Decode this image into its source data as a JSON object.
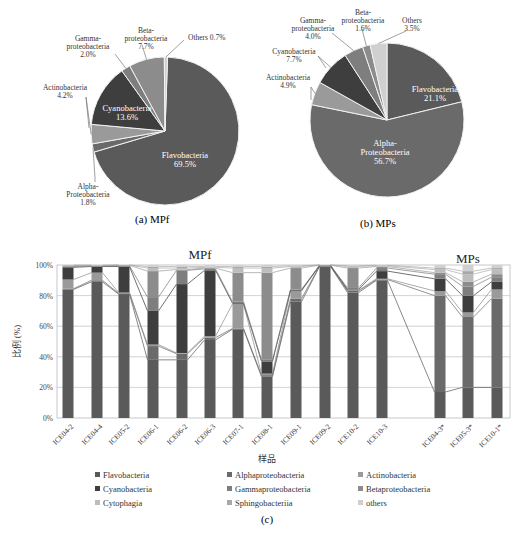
{
  "colors": {
    "Flavobacteria": "#5a5a5a",
    "Alphaproteobacteria": "#6a6a6a",
    "Actinobacteria": "#9a9a9a",
    "Cyanobacteria": "#3e3e3e",
    "Gammaproteobacteria": "#7e7e7e",
    "Betaproteobacteria": "#8c8c8c",
    "Cytophagia": "#bdbdbd",
    "Sphingobacteriia": "#a8a8a8",
    "others": "#d0d0d0"
  },
  "chart_data": [
    {
      "type": "pie",
      "id": "a",
      "caption": "(a) MPf",
      "slices": [
        {
          "name": "Flavobacteria",
          "label": "Flavobacteria",
          "pct_text": "69.5%",
          "value": 69.5
        },
        {
          "name": "Alphaproteobacteria",
          "label": "Alpha-\nProteobacteria",
          "pct_text": "1.8%",
          "value": 1.8
        },
        {
          "name": "Actinobacteria",
          "label": "Actinobacteria",
          "pct_text": "4.2%",
          "value": 4.2
        },
        {
          "name": "Cyanobacteria",
          "label": "Cyanobacteria",
          "pct_text": "13.6%",
          "value": 13.6
        },
        {
          "name": "Gammaproteobacteria",
          "label": "Gamma-\nproteobacteria",
          "pct_text": "2.0%",
          "value": 2.0
        },
        {
          "name": "Betaproteobacteria",
          "label": "Beta-\nproteobacteria",
          "pct_text": "7.7%",
          "value": 7.7
        },
        {
          "name": "others",
          "label": "Others",
          "pct_text": "0.7%",
          "value": 0.7
        }
      ]
    },
    {
      "type": "pie",
      "id": "b",
      "caption": "(b) MPs",
      "slices": [
        {
          "name": "Flavobacteria",
          "label": "Flavobacteria",
          "pct_text": "21.1%",
          "value": 21.1
        },
        {
          "name": "Alphaproteobacteria",
          "label": "Alpha-\nProteobacteria",
          "pct_text": "56.7%",
          "value": 56.7
        },
        {
          "name": "Actinobacteria",
          "label": "Actinobacteria",
          "pct_text": "4.9%",
          "value": 4.9
        },
        {
          "name": "Cyanobacteria",
          "label": "Cyanobacteria",
          "pct_text": "7.7%",
          "value": 7.7
        },
        {
          "name": "Gammaproteobacteria",
          "label": "Gamma-\nproteobacteria",
          "pct_text": "4.0%",
          "value": 4.0
        },
        {
          "name": "Betaproteobacteria",
          "label": "Beta-\nproteobacteria",
          "pct_text": "1.6%",
          "value": 1.6
        },
        {
          "name": "others",
          "label": "Others",
          "pct_text": "3.5%",
          "value": 3.5
        }
      ]
    },
    {
      "type": "bar",
      "subtype": "stacked-100",
      "id": "c",
      "caption": "(c)",
      "group_labels": [
        "MPf",
        "MPs"
      ],
      "xlabel": "样品",
      "ylabel": "比例 (%)",
      "ylim": [
        0,
        100
      ],
      "yticks": [
        "0%",
        "20%",
        "40%",
        "60%",
        "80%",
        "100%"
      ],
      "grid": true,
      "legend_position": "bottom",
      "series_order": [
        "Flavobacteria",
        "Alphaproteobacteria",
        "Actinobacteria",
        "Cyanobacteria",
        "Gammaproteobacteria",
        "Betaproteobacteria",
        "Cytophagia",
        "Sphingobacteriia",
        "others"
      ],
      "categories": [
        "ICE04-2",
        "ICE04-4",
        "ICE05-2",
        "ICE06-1",
        "ICE06-2",
        "ICE06-3",
        "ICE07-1",
        "ICE08-1",
        "ICE09-1",
        "ICE09-2",
        "ICE10-2",
        "ICE10-3",
        "ICE04-3*",
        "ICE05-3*",
        "ICE10-1*"
      ],
      "series": [
        {
          "name": "Flavobacteria",
          "values": [
            84,
            89,
            81,
            38,
            38,
            51,
            58,
            27,
            76,
            99,
            82,
            90,
            17,
            20,
            20
          ]
        },
        {
          "name": "Alphaproteobacteria",
          "values": [
            0.5,
            1,
            0.5,
            9,
            4,
            1.5,
            0.5,
            1,
            2,
            0.3,
            1,
            0.5,
            63,
            46,
            58
          ]
        },
        {
          "name": "Actinobacteria",
          "values": [
            6,
            5,
            0.5,
            1,
            0.5,
            1,
            16,
            1,
            5,
            0.2,
            0.5,
            0.5,
            3,
            3,
            6
          ]
        },
        {
          "name": "Cyanobacteria",
          "values": [
            8,
            4,
            17,
            22,
            45,
            43,
            0.5,
            8,
            0.5,
            0.2,
            0.5,
            5,
            8,
            11,
            5
          ]
        },
        {
          "name": "Gammaproteobacteria",
          "values": [
            0.5,
            0.3,
            0.5,
            9,
            9,
            1,
            1,
            1,
            0.5,
            0.1,
            1,
            2,
            3,
            6,
            3
          ]
        },
        {
          "name": "Betaproteobacteria",
          "values": [
            0.5,
            0.2,
            0.3,
            17,
            0.5,
            0.5,
            19,
            57,
            14,
            0.1,
            13,
            1,
            1,
            3,
            2
          ]
        },
        {
          "name": "Cytophagia",
          "values": [
            0.2,
            0.2,
            0.1,
            2,
            1,
            0.5,
            3,
            3,
            1,
            0.05,
            1,
            0.5,
            2,
            5,
            3
          ]
        },
        {
          "name": "Sphingobacteriia",
          "values": [
            0.2,
            0.2,
            0.1,
            1,
            1,
            0.5,
            1,
            1,
            0.5,
            0.05,
            0.5,
            0.3,
            1,
            2,
            1
          ]
        },
        {
          "name": "others",
          "values": [
            0.1,
            0.1,
            0.0,
            1,
            1,
            1,
            1,
            1,
            0.5,
            0.0,
            0.5,
            0.2,
            2,
            4,
            2
          ]
        }
      ]
    }
  ],
  "legend": {
    "rows": [
      [
        "Flavobacteria",
        "Alphaproteobacteria",
        "Actinobacteria"
      ],
      [
        "Cyanobacteria",
        "Gammaproteobacteria",
        "Betaproteobacteria"
      ],
      [
        "Cytophagia",
        "Sphingobacteriia",
        "others"
      ]
    ]
  }
}
